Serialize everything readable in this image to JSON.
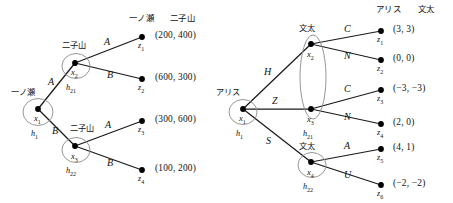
{
  "figure": {
    "kind": "extensive-form-game-trees",
    "count": 2
  },
  "left_tree": {
    "headers": [
      "一ノ瀬",
      "二子山"
    ],
    "nodes": [
      {
        "id": "x1",
        "name": "x",
        "sub": "1",
        "player": "一ノ瀬",
        "hset": "h",
        "hset_sub": "1"
      },
      {
        "id": "x2",
        "name": "x",
        "sub": "2",
        "player": "二子山",
        "hset": "h",
        "hset_sub": "21"
      },
      {
        "id": "x3",
        "name": "x",
        "sub": "3",
        "player": "二子山",
        "hset": "h",
        "hset_sub": "22"
      }
    ],
    "edges": [
      {
        "from": "x1",
        "to": "x2",
        "action": "A"
      },
      {
        "from": "x1",
        "to": "x3",
        "action": "B"
      },
      {
        "from": "x2",
        "to": "z1",
        "action": "A"
      },
      {
        "from": "x2",
        "to": "z2",
        "action": "B"
      },
      {
        "from": "x3",
        "to": "z3",
        "action": "A"
      },
      {
        "from": "x3",
        "to": "z4",
        "action": "B"
      }
    ],
    "terminals": [
      {
        "id": "z1",
        "name": "z",
        "sub": "1",
        "payoff": "(200,  400)"
      },
      {
        "id": "z2",
        "name": "z",
        "sub": "2",
        "payoff": "(600,  300)"
      },
      {
        "id": "z3",
        "name": "z",
        "sub": "3",
        "payoff": "(300,  600)"
      },
      {
        "id": "z4",
        "name": "z",
        "sub": "4",
        "payoff": "(100,  200)"
      }
    ]
  },
  "right_tree": {
    "headers": [
      "アリス",
      "文太"
    ],
    "nodes": [
      {
        "id": "x1",
        "name": "x",
        "sub": "1",
        "player": "アリス",
        "hset": "h",
        "hset_sub": "1"
      },
      {
        "id": "x2",
        "name": "x",
        "sub": "2",
        "player": "文太",
        "hset": "h",
        "hset_sub": "21"
      },
      {
        "id": "x3",
        "name": "x",
        "sub": "3",
        "player": "",
        "hset": "h",
        "hset_sub": "21"
      },
      {
        "id": "x4",
        "name": "x",
        "sub": "4",
        "player": "文太",
        "hset": "h",
        "hset_sub": "22"
      }
    ],
    "information_set": {
      "label": "h",
      "label_sub": "21",
      "members": [
        "x2",
        "x3"
      ]
    },
    "edges": [
      {
        "from": "x1",
        "to": "x2",
        "action": "H"
      },
      {
        "from": "x1",
        "to": "x3",
        "action": "Z"
      },
      {
        "from": "x1",
        "to": "x4",
        "action": "S"
      },
      {
        "from": "x2",
        "to": "z1",
        "action": "C"
      },
      {
        "from": "x2",
        "to": "z2",
        "action": "N"
      },
      {
        "from": "x3",
        "to": "z3",
        "action": "C"
      },
      {
        "from": "x3",
        "to": "z4",
        "action": "N"
      },
      {
        "from": "x4",
        "to": "z5",
        "action": "A"
      },
      {
        "from": "x4",
        "to": "z6",
        "action": "U"
      }
    ],
    "terminals": [
      {
        "id": "z1",
        "name": "z",
        "sub": "1",
        "payoff": "(3, 3)"
      },
      {
        "id": "z2",
        "name": "z",
        "sub": "2",
        "payoff": "(0, 0)"
      },
      {
        "id": "z3",
        "name": "z",
        "sub": "3",
        "payoff": "(−3, −3)"
      },
      {
        "id": "z4",
        "name": "z",
        "sub": "4",
        "payoff": "(2, 0)"
      },
      {
        "id": "z5",
        "name": "z",
        "sub": "5",
        "payoff": "(4, 1)"
      },
      {
        "id": "z6",
        "name": "z",
        "sub": "6",
        "payoff": "(−2, −2)"
      }
    ]
  },
  "style": {
    "line_color": "#1a1a1a",
    "node_fill": "#000000",
    "circle_stroke": "#6b6b6b",
    "background": "#ffffff"
  }
}
